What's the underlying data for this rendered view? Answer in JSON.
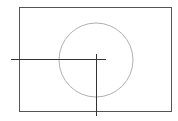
{
  "diagram": {
    "canvas": {
      "width": 178,
      "height": 121,
      "background": "#ffffff"
    },
    "frame": {
      "x": 19,
      "y": 7,
      "width": 152,
      "height": 104,
      "stroke": "#555555"
    },
    "circle": {
      "cx": 96,
      "cy": 60,
      "r": 37,
      "stroke": "#aaaaaa"
    },
    "horizontal_line": {
      "x1": 11,
      "y1": 59,
      "x2": 106,
      "y2": 59,
      "stroke": "#333333"
    },
    "vertical_line": {
      "x1": 96,
      "y1": 54,
      "x2": 96,
      "y2": 116,
      "stroke": "#333333"
    }
  }
}
